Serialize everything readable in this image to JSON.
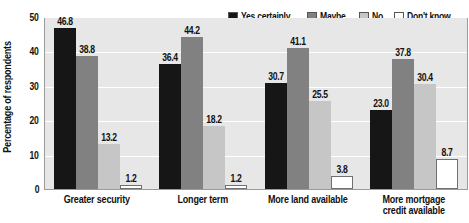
{
  "chart_data": {
    "type": "bar",
    "title": "",
    "xlabel": "",
    "ylabel": "Percentage of respondents",
    "ylim": [
      0,
      50
    ],
    "ytick_labels": [
      "50",
      "40",
      "30",
      "20",
      "10",
      "0"
    ],
    "ytick_values": [
      50,
      40,
      30,
      20,
      10,
      0
    ],
    "grid": true,
    "legend_position": "top-right",
    "categories": [
      "Greater security",
      "Longer term",
      "More land available",
      "More mortgage credit available"
    ],
    "category_lines": [
      [
        "Greater security"
      ],
      [
        "Longer term"
      ],
      [
        "More land available"
      ],
      [
        "More mortgage",
        "credit available"
      ]
    ],
    "series": [
      {
        "name": "Yes certainly",
        "color": "#161616",
        "values": [
          46.8,
          36.4,
          30.7,
          23.0
        ],
        "labels": [
          "46.8",
          "36.4",
          "30.7",
          "23.0"
        ]
      },
      {
        "name": "Maybe",
        "color": "#818181",
        "values": [
          38.8,
          44.2,
          41.1,
          37.8
        ],
        "labels": [
          "38.8",
          "44.2",
          "41.1",
          "37.8"
        ]
      },
      {
        "name": "No",
        "color": "#c6c6c6",
        "values": [
          13.2,
          18.2,
          25.5,
          30.4
        ],
        "labels": [
          "13.2",
          "18.2",
          "25.5",
          "30.4"
        ]
      },
      {
        "name": "Don't know",
        "color": "#ffffff",
        "values": [
          1.2,
          1.2,
          3.8,
          8.7
        ],
        "labels": [
          "1.2",
          "1.2",
          "3.8",
          "8.7"
        ]
      }
    ]
  },
  "axis": {
    "y_title": "Percentage of respondents"
  },
  "legend": {
    "items": [
      {
        "label": "Yes certainly"
      },
      {
        "label": "Maybe"
      },
      {
        "label": "No"
      },
      {
        "label": "Don't know"
      }
    ]
  }
}
